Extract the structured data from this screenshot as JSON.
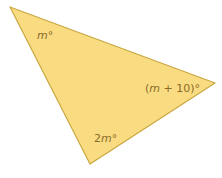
{
  "diagram": {
    "shape": "triangle",
    "fill": "#f9dc82",
    "stroke": "#c9a740",
    "vertices": {
      "top_left": [
        10,
        7
      ],
      "right": [
        215,
        83
      ],
      "bottom": [
        90,
        164
      ]
    },
    "angles": {
      "top_left": {
        "var": "m",
        "suffix": "°",
        "full": "m°"
      },
      "right": {
        "open": "(",
        "var": "m",
        "rest": " + 10)°",
        "full": "(m + 10)°"
      },
      "bottom": {
        "coef": "2",
        "var": "m",
        "suffix": "°",
        "full": "2m°"
      }
    }
  }
}
